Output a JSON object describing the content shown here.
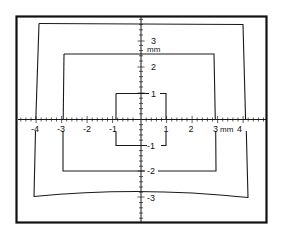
{
  "figure": {
    "frame_color": "#111111",
    "line_color": "#1a1a1a",
    "background": "#ffffff"
  },
  "axes": {
    "unit": "mm",
    "x_labels": [
      {
        "text": "-4",
        "x": 34,
        "y": 131
      },
      {
        "text": "-3",
        "x": 61,
        "y": 131
      },
      {
        "text": "-2",
        "x": 87,
        "y": 131
      },
      {
        "text": "-1",
        "x": 112,
        "y": 131
      },
      {
        "text": "1",
        "x": 166,
        "y": 131
      },
      {
        "text": "2",
        "x": 191,
        "y": 131
      },
      {
        "text": "3",
        "x": 216,
        "y": 131
      },
      {
        "text": "mm",
        "x": 232,
        "y": 131
      },
      {
        "text": "4",
        "x": 246,
        "y": 131
      }
    ],
    "y_labels": [
      {
        "text": "3",
        "x": 155,
        "y": 45
      },
      {
        "text": "mm",
        "x": 153,
        "y": 53
      },
      {
        "text": "2",
        "x": 155,
        "y": 69
      },
      {
        "text": "1",
        "x": 153,
        "y": 96
      },
      {
        "text": "-1",
        "x": 151,
        "y": 148
      },
      {
        "text": "-2",
        "x": 151,
        "y": 174
      },
      {
        "text": "-3",
        "x": 151,
        "y": 200
      }
    ]
  },
  "shapes": [
    {
      "name": "outer-distorted-square",
      "label": "±4 mm field (distorted)"
    },
    {
      "name": "middle-square",
      "label": "±3 mm field"
    },
    {
      "name": "inner-square",
      "label": "±1 mm field"
    }
  ]
}
